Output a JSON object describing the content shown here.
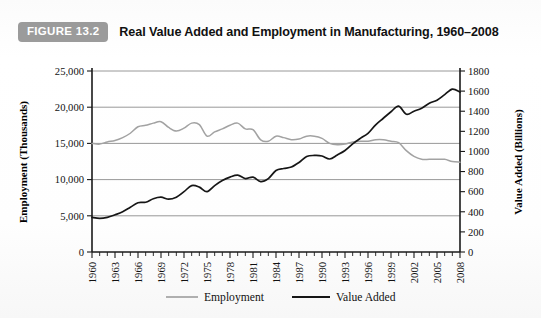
{
  "figure": {
    "badge": "FIGURE 13.2",
    "title": "Real Value Added and Employment in Manufacturing, 1960–2008"
  },
  "chart_data": {
    "type": "line",
    "title": "Real Value Added and Employment in Manufacturing, 1960–2008",
    "xlabel": "",
    "ylabel": "Employment (Thousands)",
    "y2label": "Value Added (Billions)",
    "grid": true,
    "legend_position": "bottom",
    "xlim": [
      1960,
      2008
    ],
    "ylim": [
      0,
      25000
    ],
    "y2lim": [
      0,
      1800
    ],
    "ytick_labels": [
      "0",
      "5,000",
      "10,000",
      "15,000",
      "20,000",
      "25,000"
    ],
    "ytick_values": [
      0,
      5000,
      10000,
      15000,
      20000,
      25000
    ],
    "y2tick_labels": [
      "0",
      "200",
      "400",
      "600",
      "800",
      "1000",
      "1200",
      "1400",
      "1600",
      "1800"
    ],
    "y2tick_values": [
      0,
      200,
      400,
      600,
      800,
      1000,
      1200,
      1400,
      1600,
      1800
    ],
    "xtick_labels": [
      "1960",
      "1963",
      "1966",
      "1969",
      "1972",
      "1975",
      "1978",
      "1981",
      "1984",
      "1987",
      "1990",
      "1993",
      "1996",
      "1999",
      "2002",
      "2005",
      "2008"
    ],
    "xtick_values": [
      1960,
      1963,
      1966,
      1969,
      1972,
      1975,
      1978,
      1981,
      1984,
      1987,
      1990,
      1993,
      1996,
      1999,
      2002,
      2005,
      2008
    ],
    "x": [
      1960,
      1961,
      1962,
      1963,
      1964,
      1965,
      1966,
      1967,
      1968,
      1969,
      1970,
      1971,
      1972,
      1973,
      1974,
      1975,
      1976,
      1977,
      1978,
      1979,
      1980,
      1981,
      1982,
      1983,
      1984,
      1985,
      1986,
      1987,
      1988,
      1989,
      1990,
      1991,
      1992,
      1993,
      1994,
      1995,
      1996,
      1997,
      1998,
      1999,
      2000,
      2001,
      2002,
      2003,
      2004,
      2005,
      2006,
      2007,
      2008
    ],
    "series": [
      {
        "name": "Employment",
        "axis": "left",
        "unit": "thousands",
        "color": "#a2a2a2",
        "values": [
          15000,
          14900,
          15200,
          15400,
          15800,
          16400,
          17300,
          17500,
          17800,
          18000,
          17200,
          16700,
          17100,
          17800,
          17600,
          16000,
          16600,
          17000,
          17500,
          17800,
          17000,
          16900,
          15500,
          15300,
          16000,
          15800,
          15500,
          15600,
          16000,
          16000,
          15700,
          15000,
          14800,
          14900,
          15200,
          15300,
          15300,
          15500,
          15500,
          15300,
          15100,
          14000,
          13200,
          12800,
          12800,
          12800,
          12800,
          12500,
          12400
        ]
      },
      {
        "name": "Value Added",
        "axis": "right",
        "unit": "billions",
        "color": "#161616",
        "values": [
          345,
          335,
          345,
          370,
          400,
          445,
          490,
          495,
          530,
          545,
          525,
          545,
          600,
          660,
          645,
          600,
          660,
          710,
          745,
          765,
          730,
          745,
          700,
          730,
          810,
          830,
          845,
          890,
          950,
          960,
          955,
          925,
          965,
          1010,
          1075,
          1130,
          1180,
          1265,
          1330,
          1395,
          1450,
          1370,
          1400,
          1430,
          1480,
          1510,
          1565,
          1620,
          1590
        ]
      }
    ]
  },
  "axes": {
    "left_title": "Employment (Thousands)",
    "right_title": "Value Added (Billions)"
  },
  "legend": {
    "items": [
      {
        "label": "Employment",
        "color": "#a2a2a2"
      },
      {
        "label": "Value Added",
        "color": "#161616"
      }
    ]
  }
}
